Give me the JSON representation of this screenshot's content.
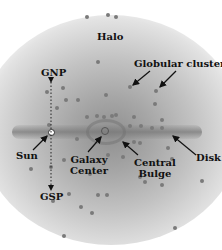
{
  "diagram": {
    "labels": {
      "halo": "Halo",
      "globular_clusters": "Globular clusters",
      "gnp": "GNP",
      "gsp": "GSP",
      "sun": "Sun",
      "galaxy_center_line1": "Galaxy",
      "galaxy_center_line2": "Center",
      "central_bulge_line1": "Central",
      "central_bulge_line2": "Bulge",
      "disk": "Disk"
    },
    "colors": {
      "background": "#ffffff",
      "halo_core": "#8f8f8f",
      "cluster_dot": "#7a7a7a",
      "text": "#111111"
    }
  }
}
